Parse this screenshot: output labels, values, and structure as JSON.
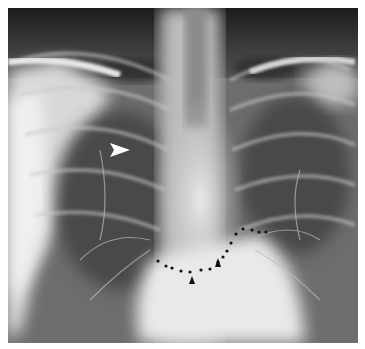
{
  "figure": {
    "type": "chest-radiograph",
    "view": "frontal",
    "annotations": {
      "white_arrowhead": {
        "x": 118,
        "y": 146,
        "direction": "right"
      },
      "black_arrowheads": [
        {
          "x": 192,
          "y": 282
        },
        {
          "x": 218,
          "y": 264
        }
      ],
      "dotted_contour": [
        [
          158,
          261
        ],
        [
          166,
          266
        ],
        [
          172,
          268
        ],
        [
          181,
          271
        ],
        [
          190,
          272
        ],
        [
          201,
          270
        ],
        [
          210,
          269
        ],
        [
          218,
          262
        ],
        [
          223,
          257
        ],
        [
          227,
          251
        ],
        [
          231,
          243
        ],
        [
          236,
          234
        ],
        [
          243,
          229
        ],
        [
          252,
          230
        ],
        [
          259,
          232
        ],
        [
          266,
          232
        ]
      ]
    },
    "colors": {
      "background": "#ffffff",
      "dark": "#1e1e1e",
      "bright": "#f2f2f2"
    }
  }
}
